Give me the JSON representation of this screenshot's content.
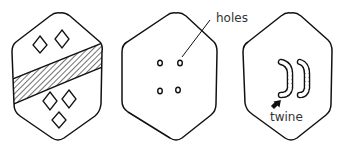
{
  "figure": {
    "panels": [
      {
        "id": "shield-front",
        "description": "Shield front with diagonal hatched band and diamond motifs",
        "diamonds_above": 2,
        "diamonds_below": 3
      },
      {
        "id": "shield-back-holes",
        "description": "Shield back showing four holes",
        "holes": 4
      },
      {
        "id": "shield-back-twine",
        "description": "Shield back with twine threaded through holes forming handles"
      }
    ],
    "labels": {
      "holes": "holes",
      "twine": "twine"
    },
    "colors": {
      "stroke": "#111111",
      "text": "#333333",
      "background": "#ffffff"
    }
  }
}
